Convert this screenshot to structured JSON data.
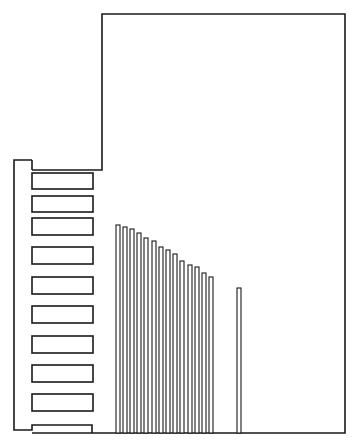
{
  "diagram": {
    "title": "Heat sink / component assembly line drawing",
    "stroke_color": "#1a1a1a",
    "background": "#ffffff",
    "body": {
      "points": [
        [
          102,
          14
        ],
        [
          345,
          14
        ],
        [
          345,
          433
        ],
        [
          32,
          433
        ]
      ],
      "step": {
        "x_left": 32,
        "x_right": 102,
        "y": 170
      }
    },
    "bracket": {
      "x_left": 14,
      "x_right": 32,
      "y_top": 160,
      "y_bottom": 430
    },
    "slots": [
      {
        "y": 173,
        "h": 16
      },
      {
        "y": 196,
        "h": 16
      },
      {
        "y": 218,
        "h": 17
      },
      {
        "y": 247,
        "h": 17
      },
      {
        "y": 277,
        "h": 17
      },
      {
        "y": 306,
        "h": 17
      },
      {
        "y": 336,
        "h": 17
      },
      {
        "y": 365,
        "h": 17
      },
      {
        "y": 394,
        "h": 17
      }
    ],
    "slot_x": 32,
    "slot_w": 61,
    "fins": [
      {
        "x": 116,
        "top": 225
      },
      {
        "x": 123,
        "top": 227
      },
      {
        "x": 130,
        "top": 229
      },
      {
        "x": 137,
        "top": 233
      },
      {
        "x": 144,
        "top": 238
      },
      {
        "x": 152,
        "top": 241
      },
      {
        "x": 159,
        "top": 247
      },
      {
        "x": 166,
        "top": 250
      },
      {
        "x": 173,
        "top": 254
      },
      {
        "x": 180,
        "top": 261
      },
      {
        "x": 188,
        "top": 265
      },
      {
        "x": 195,
        "top": 267
      },
      {
        "x": 202,
        "top": 273
      },
      {
        "x": 209,
        "top": 277
      },
      {
        "x": 237,
        "top": 288
      }
    ],
    "fin_w": 4,
    "fin_bottom": 433
  }
}
